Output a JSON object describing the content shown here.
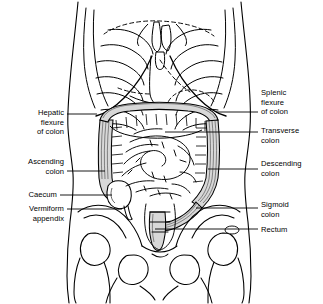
{
  "figure": {
    "background_color": "#ffffff",
    "line_color": "#000000",
    "colon_shading_color": "#d8d8d8",
    "width": 323,
    "height": 304
  },
  "labels": {
    "left": [
      {
        "id": "hepatic-flexure-of-colon",
        "lines": [
          "Hepatic",
          "flexure",
          "of colon"
        ],
        "text": "Hepatic flexure of colon",
        "text_right_x": 64,
        "text_top_y": 108,
        "leader": {
          "x1": 67,
          "y1": 114,
          "x2": 97,
          "y2": 114
        }
      },
      {
        "id": "ascending-colon",
        "lines": [
          "Ascending",
          "colon"
        ],
        "text": "Ascending colon",
        "text_right_x": 64,
        "text_top_y": 157,
        "leader": {
          "x1": 67,
          "y1": 171,
          "x2": 105,
          "y2": 171
        }
      },
      {
        "id": "caecum",
        "lines": [
          "Caecum"
        ],
        "text": "Caecum",
        "text_right_x": 57,
        "text_top_y": 190,
        "leader": {
          "x1": 60,
          "y1": 195,
          "x2": 112,
          "y2": 195
        }
      },
      {
        "id": "vermiform-appendix",
        "lines": [
          "Vermiform",
          "appendix"
        ],
        "text": "Vermiform appendix",
        "text_right_x": 64,
        "text_top_y": 204,
        "leader": {
          "x1": 67,
          "y1": 209,
          "x2": 122,
          "y2": 209
        }
      }
    ],
    "right": [
      {
        "id": "splenic-flexure-of-colon",
        "lines": [
          "Splenic",
          "flexure",
          "of colon"
        ],
        "text": "Splenic flexure of colon",
        "text_left_x": 261,
        "text_top_y": 88,
        "leader": {
          "x1": 216,
          "y1": 112,
          "x2": 258,
          "y2": 112
        }
      },
      {
        "id": "transverse-colon",
        "lines": [
          "Transverse",
          "colon"
        ],
        "text": "Transverse colon",
        "text_left_x": 261,
        "text_top_y": 126,
        "leader": {
          "x1": 165,
          "y1": 132,
          "x2": 258,
          "y2": 132
        }
      },
      {
        "id": "descending-colon",
        "lines": [
          "Descending",
          "colon"
        ],
        "text": "Descending colon",
        "text_left_x": 261,
        "text_top_y": 159,
        "leader": {
          "x1": 208,
          "y1": 169,
          "x2": 258,
          "y2": 169
        }
      },
      {
        "id": "sigmoid-colon",
        "lines": [
          "Sigmoid",
          "colon"
        ],
        "text": "Sigmoid colon",
        "text_left_x": 261,
        "text_top_y": 200,
        "leader": {
          "x1": 196,
          "y1": 208,
          "x2": 258,
          "y2": 208
        }
      },
      {
        "id": "rectum",
        "lines": [
          "Rectum"
        ],
        "text": "Rectum",
        "text_left_x": 261,
        "text_top_y": 225,
        "leader": {
          "x1": 155,
          "y1": 229,
          "x2": 258,
          "y2": 229
        }
      }
    ]
  },
  "anatomy": {
    "structures": [
      "torso-outline",
      "rib-cage-left",
      "rib-cage-right",
      "sternum",
      "costal-margin",
      "diaphragm-dashed",
      "liver-outline",
      "stomach-dashed",
      "ascending-colon",
      "transverse-colon",
      "descending-colon",
      "sigmoid-colon",
      "rectum",
      "caecum",
      "vermiform-appendix",
      "small-intestine-coils",
      "pelvis",
      "sacrum",
      "femur-head-left",
      "femur-head-right"
    ]
  }
}
